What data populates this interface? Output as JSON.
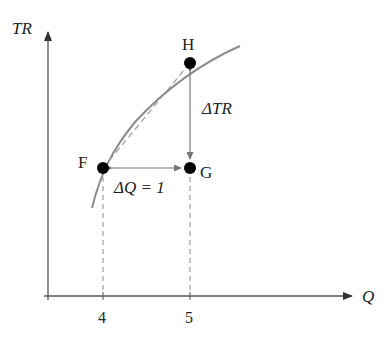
{
  "axes": {
    "y_label": "TR",
    "x_label": "Q",
    "x_ticks": [
      "4",
      "5"
    ]
  },
  "points": {
    "F": "F",
    "G": "G",
    "H": "H"
  },
  "annotations": {
    "delta_tr": "ΔTR",
    "delta_q": "ΔQ = 1"
  },
  "colors": {
    "curve": "#8c8c8c",
    "axis": "#555555",
    "point": "#000000"
  }
}
